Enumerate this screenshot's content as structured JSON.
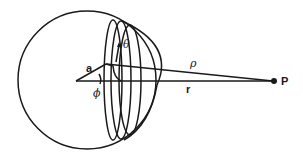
{
  "diagram": {
    "type": "geometry",
    "colors": {
      "stroke": "#1a1a1a",
      "background": "#ffffff"
    },
    "labels": {
      "radius": "a",
      "azimuth_angle": "ϕ",
      "polar_angle": "θ",
      "ring_distance": "ρ",
      "center_distance": "r",
      "point": "P"
    }
  }
}
